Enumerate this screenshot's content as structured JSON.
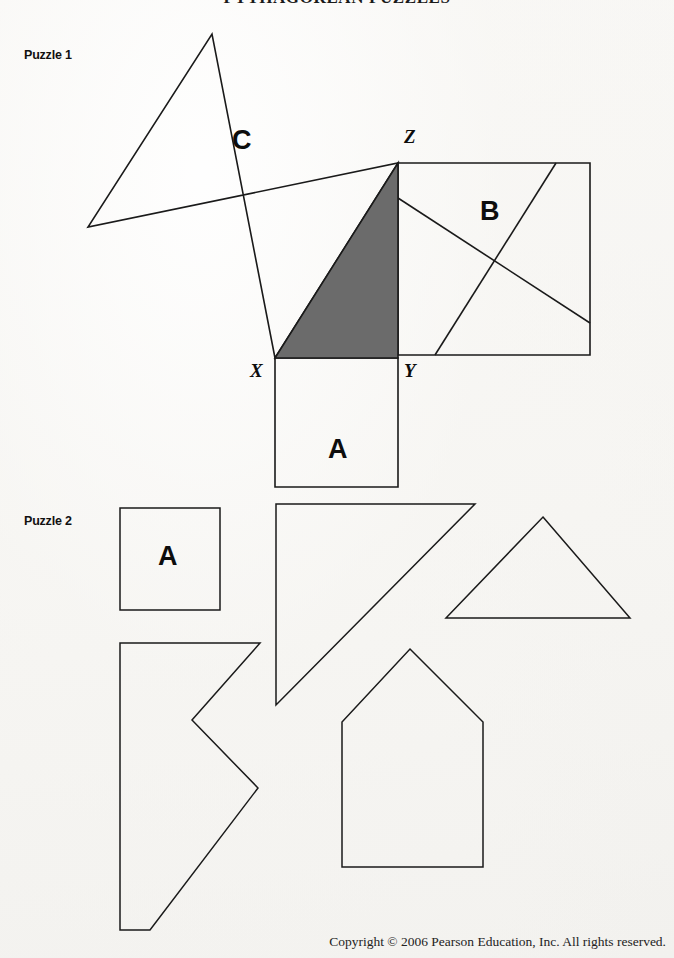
{
  "document": {
    "title": "PYTHAGOREAN PUZZLES",
    "copyright": "Copyright © 2006 Pearson Education, Inc. All rights reserved.",
    "page_background": "#f7f6f4",
    "stroke_color": "#1a1a1a",
    "shaded_triangle_fill": "#6b6b6b"
  },
  "puzzle1": {
    "label": "Puzzle 1",
    "region_labels": [
      {
        "text": "C",
        "x": 232,
        "y": 127
      },
      {
        "text": "B",
        "x": 480,
        "y": 198
      },
      {
        "text": "A",
        "x": 328,
        "y": 436
      }
    ],
    "vertex_labels": [
      {
        "text": "X",
        "x": 250,
        "y": 361
      },
      {
        "text": "Y",
        "x": 404,
        "y": 361
      },
      {
        "text": "Z",
        "x": 404,
        "y": 127
      }
    ],
    "triangle": {
      "name": "shaded-right-triangle",
      "points": "275,358 398,358 398,163",
      "fill": "#6b6b6b"
    },
    "square_a": {
      "name": "square-a",
      "points": "275,358 398,358 398,487 275,487"
    },
    "square_b": {
      "name": "square-b",
      "points": "398,163 590,163 590,355 398,355",
      "cuts": [
        {
          "name": "cut-b-descending",
          "x1": 398,
          "y1": 198,
          "x2": 590,
          "y2": 323
        },
        {
          "name": "cut-b-ascending",
          "x1": 435,
          "y1": 355,
          "x2": 556,
          "y2": 163
        }
      ]
    },
    "square_c": {
      "name": "square-c",
      "points": "275,358 212,34 88,227 398,163"
    }
  },
  "puzzle2": {
    "label": "Puzzle 2",
    "region_labels": [
      {
        "text": "A",
        "x": 158,
        "y": 543
      }
    ],
    "pieces": [
      {
        "name": "piece-square-a",
        "points": "120,508 220,508 220,610 120,610"
      },
      {
        "name": "piece-large-triangle",
        "points": "276,504 475,504 276,705"
      },
      {
        "name": "piece-small-triangle",
        "points": "543,517 630,618 446,618"
      },
      {
        "name": "piece-chevron",
        "points": "120,643 260,643 192,720 258,788 150,930 120,930"
      },
      {
        "name": "piece-house-pentagon",
        "points": "410,649 483,722 483,867 342,867 342,722"
      }
    ]
  }
}
